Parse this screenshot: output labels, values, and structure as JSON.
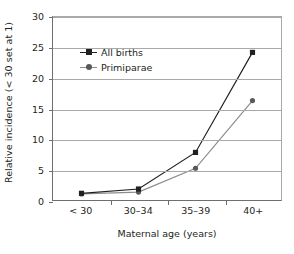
{
  "chart_data": {
    "type": "line",
    "title": "",
    "subtitle": "",
    "xlabel": "Maternal age (years)",
    "ylabel": "Relative incidence (< 30 set at 1)",
    "categories": [
      "< 30",
      "30–34",
      "35–39",
      "40+"
    ],
    "yticks": [
      0,
      5,
      10,
      15,
      20,
      25,
      30
    ],
    "ylim": [
      0,
      30
    ],
    "grid": "horizontal",
    "legend_position": "inside-upper-left",
    "series": [
      {
        "name": "All births",
        "values": [
          1.1,
          1.8,
          7.8,
          24.2
        ],
        "color": "#231f20",
        "marker": "square"
      },
      {
        "name": "Primiparae",
        "values": [
          1.0,
          1.3,
          5.2,
          16.3
        ],
        "color": "#8c8c8c",
        "marker": "circle"
      }
    ]
  },
  "axes": {
    "y_title": "Relative incidence (< 30 set at 1)",
    "x_title": "Maternal age (years)",
    "y_tick_labels": [
      "0",
      "5",
      "10",
      "15",
      "20",
      "25",
      "30"
    ],
    "x_tick_labels": [
      "< 30",
      "30–34",
      "35–39",
      "40+"
    ]
  },
  "legend": {
    "entries": [
      {
        "label": "All births"
      },
      {
        "label": "Primiparae"
      }
    ]
  },
  "colors": {
    "series_1": "#231f20",
    "series_2": "#8c8c8c",
    "grid": "#a7a9ac",
    "axis": "#6d6e71",
    "text": "#231f20",
    "background": "#ffffff"
  }
}
